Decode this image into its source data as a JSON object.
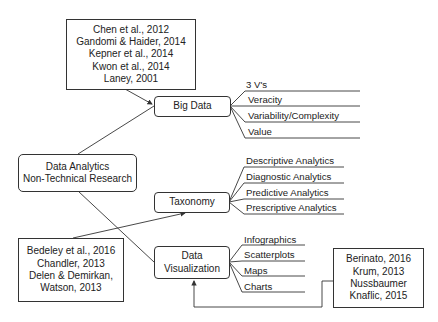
{
  "diagram": {
    "root": {
      "lines": [
        "Data Analytics",
        "Non-Technical Research"
      ]
    },
    "nodes": {
      "big_data": {
        "label": "Big Data",
        "leaves": [
          "3 V's",
          "Veracity",
          "Variability/Complexity",
          "Value"
        ],
        "references": [
          "Chen et al., 2012",
          "Gandomi & Haider, 2014",
          "Kepner et al., 2014",
          "Kwon et al., 2014",
          "Laney, 2001"
        ]
      },
      "taxonomy": {
        "label": "Taxonomy",
        "leaves": [
          "Descriptive Analytics",
          "Diagnostic Analytics",
          "Predictive Analytics",
          "Prescriptive Analytics"
        ],
        "references": [
          "Bedeley et al., 2016",
          "Chandler, 2013",
          "Delen & Demirkan,",
          "Watson, 2013"
        ]
      },
      "data_visualization": {
        "lines": [
          "Data",
          "Visualization"
        ],
        "leaves": [
          "Infographics",
          "Scatterplots",
          "Maps",
          "Charts"
        ],
        "references": [
          "Berinato, 2016",
          "Krum, 2013",
          "Nussbaumer",
          "Knaflic, 2015"
        ]
      }
    },
    "colors": {
      "line": "#333333",
      "text": "#222222",
      "background": "#ffffff"
    }
  }
}
